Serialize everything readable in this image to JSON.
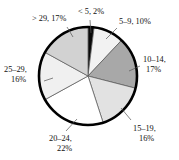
{
  "chart_data": {
    "type": "pie",
    "title": "",
    "subtitle": "",
    "xlabel": "",
    "ylabel": "",
    "legend_position": "none",
    "grid": false,
    "start_angle_deg": 0,
    "direction": "clockwise",
    "units": "percent",
    "categories": [
      "< 5",
      "5–9",
      "10–14",
      "15–19",
      "20–24",
      "25–29",
      "> 29"
    ],
    "values": [
      2,
      10,
      17,
      16,
      22,
      16,
      17
    ],
    "labels": [
      "< 5, 2%",
      "5–9, 10%",
      "10–14,",
      "15–19,",
      "20–24,",
      "25–29,",
      "> 29, 17%"
    ],
    "slices": [
      {
        "name": "lt-5",
        "category": "< 5",
        "value": 2,
        "label_line1": "< 5, 2%",
        "label_line2": "",
        "color": "#0a0a0a"
      },
      {
        "name": "5-9",
        "category": "5–9",
        "value": 10,
        "label_line1": "5–9, 10%",
        "label_line2": "",
        "color": "#f2f2f2"
      },
      {
        "name": "10-14",
        "category": "10–14",
        "value": 17,
        "label_line1": "10–14,",
        "label_line2": "17%",
        "color": "#a8a8a8"
      },
      {
        "name": "15-19",
        "category": "15–19",
        "value": 16,
        "label_line1": "15–19,",
        "label_line2": "16%",
        "color": "#e2e2e2"
      },
      {
        "name": "20-24",
        "category": "20–24",
        "value": 22,
        "label_line1": "20–24,",
        "label_line2": "22%",
        "color": "#ffffff"
      },
      {
        "name": "25-29",
        "category": "25–29",
        "value": 16,
        "label_line1": "25–29,",
        "label_line2": "16%",
        "color": "#f0f0f0"
      },
      {
        "name": "gt-29",
        "category": "> 29",
        "value": 17,
        "label_line1": "> 29, 17%",
        "label_line2": "",
        "color": "#d2d2d2"
      }
    ],
    "outline_color": "#000000",
    "divider_color": "#555555",
    "background_color": "#ffffff"
  }
}
